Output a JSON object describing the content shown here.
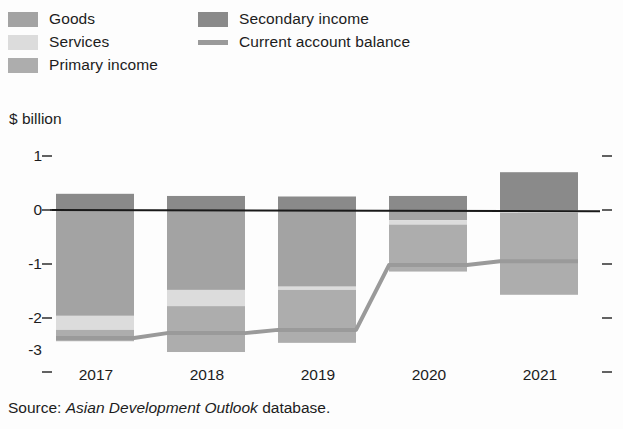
{
  "legend": {
    "items": [
      {
        "id": "goods",
        "label": "Goods",
        "type": "swatch",
        "color": "#a3a3a3"
      },
      {
        "id": "services",
        "label": "Services",
        "type": "swatch",
        "color": "#dcdcdc"
      },
      {
        "id": "primary",
        "label": "Primary income",
        "type": "swatch",
        "color": "#adadad"
      },
      {
        "id": "secondary",
        "label": "Secondary income",
        "type": "swatch",
        "color": "#8a8a8a"
      },
      {
        "id": "balance",
        "label": "Current account balance",
        "type": "line",
        "color": "#9a9a9a"
      }
    ]
  },
  "axis": {
    "unit_label": "$ billion",
    "y_ticks": [
      "1",
      "0",
      "-1",
      "-2",
      "-3"
    ],
    "x_ticks": [
      "2017",
      "2018",
      "2019",
      "2020",
      "2021"
    ]
  },
  "source": {
    "prefix": "Source: ",
    "italic": "Asian Development Outlook",
    "suffix": " database."
  },
  "chart_data": {
    "type": "bar",
    "title": "",
    "subtitle": "",
    "xlabel": "",
    "ylabel": "$ billion",
    "ylim": [
      -3.2,
      1.2
    ],
    "grid": false,
    "legend_position": "top",
    "stacked": true,
    "categories": [
      "2017",
      "2018",
      "2019",
      "2020",
      "2021"
    ],
    "series": [
      {
        "name": "Goods",
        "color": "#a3a3a3",
        "values": [
          -1.96,
          -1.48,
          -1.42,
          -0.19,
          0.0
        ]
      },
      {
        "name": "Services",
        "color": "#dcdcdc",
        "values": [
          -0.26,
          -0.3,
          -0.06,
          -0.08,
          -0.05
        ]
      },
      {
        "name": "Primary income",
        "color": "#adadad",
        "values": [
          -0.21,
          -0.85,
          -0.98,
          -0.87,
          -1.52
        ]
      },
      {
        "name": "Secondary income",
        "color": "#8a8a8a",
        "values": [
          0.3,
          0.26,
          0.25,
          0.26,
          0.7
        ]
      }
    ],
    "line_series": {
      "name": "Current account balance",
      "color": "#9a9a9a",
      "values": [
        -2.37,
        -2.28,
        -2.22,
        -1.02,
        -0.95
      ]
    }
  }
}
